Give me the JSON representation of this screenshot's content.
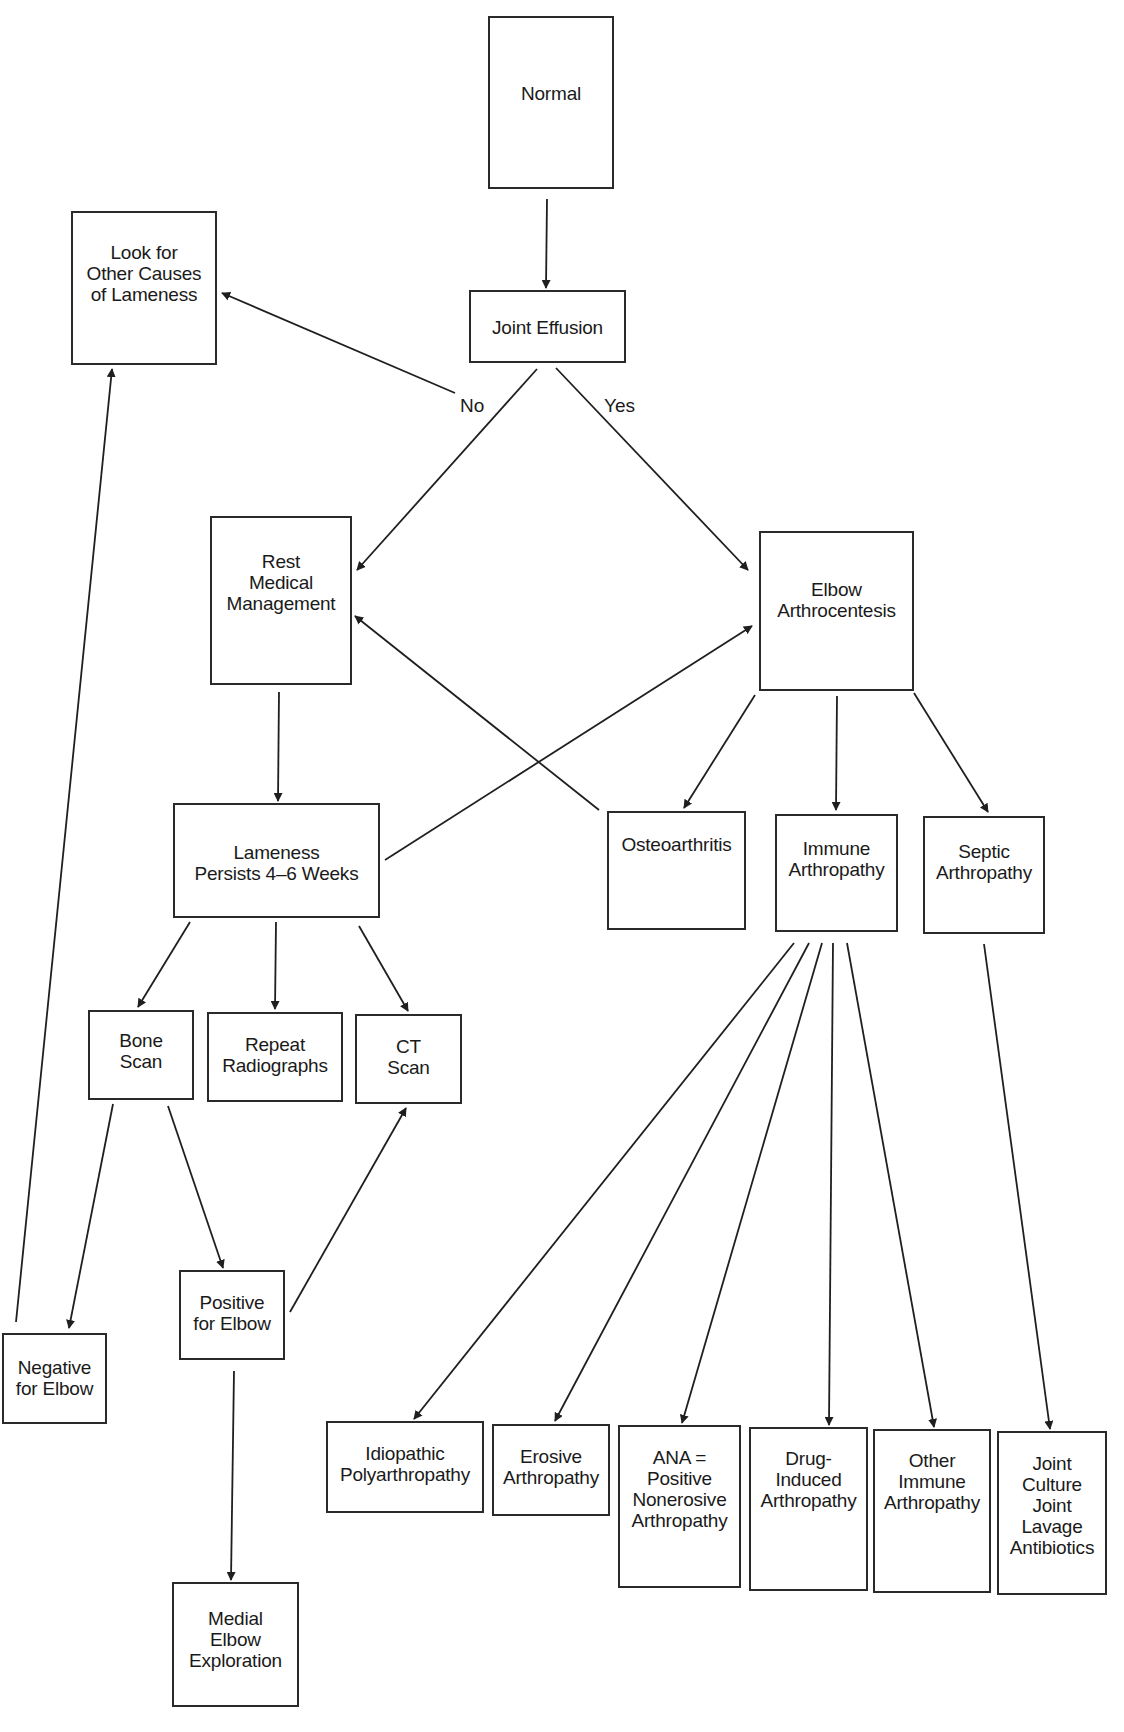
{
  "diagram": {
    "type": "flowchart",
    "nodes": {
      "normal": {
        "label": "Normal"
      },
      "look_other": {
        "label": "Look for\nOther Causes\nof Lameness"
      },
      "joint_eff": {
        "label": "Joint Effusion"
      },
      "rest": {
        "label": "Rest\nMedical\nManagement"
      },
      "elbow_arthro": {
        "label": "Elbow\nArthrocentesis"
      },
      "lameness": {
        "label": "Lameness\nPersists 4–6 Weeks"
      },
      "osteo": {
        "label": "Osteoarthritis"
      },
      "immune": {
        "label": "Immune\nArthropathy"
      },
      "septic": {
        "label": "Septic\nArthropathy"
      },
      "bone_scan": {
        "label": "Bone\nScan"
      },
      "repeat_rad": {
        "label": "Repeat\nRadiographs"
      },
      "ct_scan": {
        "label": "CT\nScan"
      },
      "positive": {
        "label": "Positive\nfor Elbow"
      },
      "negative": {
        "label": "Negative\nfor Elbow"
      },
      "idiopathic": {
        "label": "Idiopathic\nPolyarthropathy"
      },
      "erosive": {
        "label": "Erosive\nArthropathy"
      },
      "ana": {
        "label": "ANA =\nPositive\nNonerosive\nArthropathy"
      },
      "drug": {
        "label": "Drug-\nInduced\nArthropathy"
      },
      "other_imm": {
        "label": "Other\nImmune\nArthropathy"
      },
      "joint_culture": {
        "label": "Joint\nCulture\nJoint\nLavage\nAntibiotics"
      },
      "medial": {
        "label": "Medial\nElbow\nExploration"
      }
    },
    "edge_labels": {
      "no": "No",
      "yes": "Yes"
    },
    "edges": [
      {
        "from": "Normal",
        "to": "Joint Effusion"
      },
      {
        "from": "Joint Effusion",
        "to": "Look for Other Causes of Lameness",
        "label": "No"
      },
      {
        "from": "Joint Effusion",
        "to": "Rest Medical Management",
        "label": "No"
      },
      {
        "from": "Joint Effusion",
        "to": "Elbow Arthrocentesis",
        "label": "Yes"
      },
      {
        "from": "Rest Medical Management",
        "to": "Lameness Persists 4–6 Weeks"
      },
      {
        "from": "Lameness Persists 4–6 Weeks",
        "to": "Elbow Arthrocentesis"
      },
      {
        "from": "Osteoarthritis",
        "to": "Rest Medical Management"
      },
      {
        "from": "Elbow Arthrocentesis",
        "to": "Osteoarthritis"
      },
      {
        "from": "Elbow Arthrocentesis",
        "to": "Immune Arthropathy"
      },
      {
        "from": "Elbow Arthrocentesis",
        "to": "Septic Arthropathy"
      },
      {
        "from": "Lameness Persists 4–6 Weeks",
        "to": "Bone Scan"
      },
      {
        "from": "Lameness Persists 4–6 Weeks",
        "to": "Repeat Radiographs"
      },
      {
        "from": "Lameness Persists 4–6 Weeks",
        "to": "CT Scan"
      },
      {
        "from": "Bone Scan",
        "to": "Negative for Elbow"
      },
      {
        "from": "Bone Scan",
        "to": "Positive for Elbow"
      },
      {
        "from": "Positive for Elbow",
        "to": "CT Scan"
      },
      {
        "from": "Positive for Elbow",
        "to": "Medial Elbow Exploration"
      },
      {
        "from": "Negative for Elbow",
        "to": "Look for Other Causes of Lameness"
      },
      {
        "from": "Immune Arthropathy",
        "to": "Idiopathic Polyarthropathy"
      },
      {
        "from": "Immune Arthropathy",
        "to": "Erosive Arthropathy"
      },
      {
        "from": "Immune Arthropathy",
        "to": "ANA = Positive Nonerosive Arthropathy"
      },
      {
        "from": "Immune Arthropathy",
        "to": "Drug-Induced Arthropathy"
      },
      {
        "from": "Immune Arthropathy",
        "to": "Other Immune Arthropathy"
      },
      {
        "from": "Septic Arthropathy",
        "to": "Joint Culture Joint Lavage Antibiotics"
      }
    ]
  }
}
